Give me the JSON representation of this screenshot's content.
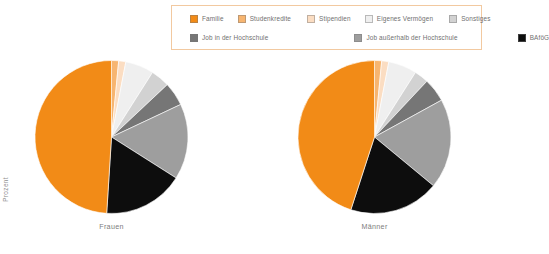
{
  "axis": {
    "y_label": "Prozent"
  },
  "legend": {
    "position": "top",
    "rows": [
      [
        {
          "label": "Familie",
          "color": "#F28B17",
          "key": "familie"
        },
        {
          "label": "Studenkredite",
          "color": "#F7B570",
          "key": "studenkredite"
        },
        {
          "label": "Stipendien",
          "color": "#FBDDC2",
          "key": "stipendien"
        },
        {
          "label": "Eigenes Vermögen",
          "color": "#EFEFEF",
          "key": "eigenes-vermoegen"
        },
        {
          "label": "Sonstiges",
          "color": "#D2D2D2",
          "key": "sonstiges"
        }
      ],
      [
        {
          "label": "Job in der Hochschule",
          "color": "#767676",
          "key": "job-in-der-hochschule"
        },
        {
          "label": "Job außerhalb der Hochschule",
          "color": "#9E9E9E",
          "key": "job-ausserhalb-der-hochschule"
        },
        {
          "label": "BAföG",
          "color": "#0D0D0D",
          "key": "bafoeg"
        }
      ]
    ]
  },
  "chart_data": {
    "type": "pie",
    "title": "",
    "xlabel": "",
    "ylabel": "Prozent",
    "legend_position": "top",
    "grid": false,
    "categories": [
      "Familie",
      "Studenkredite",
      "Stipendien",
      "Eigenes Vermögen",
      "Sonstiges",
      "Job in der Hochschule",
      "Job außerhalb der Hochschule",
      "BAföG"
    ],
    "colors": [
      "#F28B17",
      "#F7B570",
      "#FBDDC2",
      "#EFEFEF",
      "#D2D2D2",
      "#767676",
      "#9E9E9E",
      "#0D0D0D"
    ],
    "charts": [
      {
        "name": "Frauen",
        "label": "Frauen",
        "values": [
          49,
          1.5,
          1.5,
          6,
          4,
          5,
          16,
          17
        ]
      },
      {
        "name": "Männer",
        "label": "Männer",
        "values": [
          45,
          1.5,
          1.5,
          6,
          3,
          5,
          19,
          19
        ]
      }
    ]
  },
  "captions": {
    "left": "Frauen",
    "right": "Männer"
  }
}
